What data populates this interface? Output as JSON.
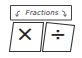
{
  "widget": {
    "title": "Fractions",
    "left_arrow_icon": "curly-arrow-left-icon",
    "right_arrow_icon": "curly-arrow-right-icon",
    "cards": [
      {
        "name": "multiply",
        "symbol": "×"
      },
      {
        "name": "divide",
        "symbol": "÷"
      }
    ]
  }
}
